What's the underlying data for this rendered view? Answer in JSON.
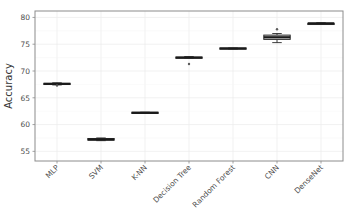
{
  "chart_data": {
    "type": "box",
    "title": "",
    "xlabel": "",
    "ylabel": "Accuracy",
    "ylim": [
      53.2,
      81.2
    ],
    "yticks": [
      55,
      60,
      65,
      70,
      75,
      80
    ],
    "ytick_labels": [
      "55",
      "60",
      "65",
      "70",
      "75",
      "80"
    ],
    "grid": true,
    "legend": "none",
    "categories": [
      "MLP",
      "SVM",
      "K-NN",
      "Decision Tree",
      "Random Forest",
      "CNN",
      "DenseNet"
    ],
    "series": [
      {
        "name": "MLP",
        "min": 67.4,
        "q1": 67.5,
        "median": 67.6,
        "q3": 67.7,
        "max": 67.8,
        "outliers": [
          67.3
        ]
      },
      {
        "name": "SVM",
        "min": 57.0,
        "q1": 57.1,
        "median": 57.2,
        "q3": 57.4,
        "max": 57.5,
        "outliers": []
      },
      {
        "name": "K-NN",
        "min": 62.1,
        "q1": 62.2,
        "median": 62.2,
        "q3": 62.3,
        "max": 62.3,
        "outliers": []
      },
      {
        "name": "Decision Tree",
        "min": 72.4,
        "q1": 72.4,
        "median": 72.5,
        "q3": 72.6,
        "max": 72.7,
        "outliers": [
          71.3
        ]
      },
      {
        "name": "Random Forest",
        "min": 74.1,
        "q1": 74.2,
        "median": 74.2,
        "q3": 74.3,
        "max": 74.3,
        "outliers": []
      },
      {
        "name": "CNN",
        "min": 75.3,
        "q1": 75.9,
        "median": 76.3,
        "q3": 76.7,
        "max": 77.0,
        "outliers": [
          77.8
        ]
      },
      {
        "name": "DenseNet",
        "min": 78.7,
        "q1": 78.8,
        "median": 78.9,
        "q3": 78.9,
        "max": 79.0,
        "outliers": []
      }
    ],
    "colors": {
      "box_fill": "#d9d9d9",
      "box_stroke": "#2b2b2b",
      "median": "#1a1a1a",
      "outlier": "#5a5a5a",
      "panel_border": "#8c8c8c",
      "grid_major": "#ebebeb",
      "text": "#4d4d4d"
    }
  }
}
